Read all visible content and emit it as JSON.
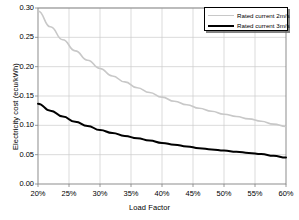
{
  "chart_data": {
    "type": "line",
    "title": "",
    "xlabel": "Load Factor",
    "ylabel": "Electricity cost (ecu/kWh)",
    "xlim": [
      20,
      60
    ],
    "ylim": [
      0.0,
      0.3
    ],
    "grid": true,
    "legend_position": "top-right",
    "x_tick_labels": [
      "20%",
      "25%",
      "30%",
      "35%",
      "40%",
      "45%",
      "50%",
      "55%",
      "60%"
    ],
    "x_tick_values": [
      20,
      25,
      30,
      35,
      40,
      45,
      50,
      55,
      60
    ],
    "y_tick_labels": [
      "0.00",
      "0.05",
      "0.10",
      "0.15",
      "0.20",
      "0.25",
      "0.30"
    ],
    "y_tick_values": [
      0.0,
      0.05,
      0.1,
      0.15,
      0.2,
      0.25,
      0.3
    ],
    "x": [
      20,
      22,
      24,
      26,
      28,
      30,
      32,
      34,
      36,
      38,
      40,
      42,
      44,
      46,
      48,
      50,
      52,
      54,
      56,
      58,
      60
    ],
    "series": [
      {
        "name": "Rated current 2m/s",
        "color": "#c8c8c8",
        "width": 1.6,
        "values": [
          0.295,
          0.268,
          0.246,
          0.227,
          0.211,
          0.197,
          0.184,
          0.174,
          0.164,
          0.156,
          0.148,
          0.141,
          0.135,
          0.129,
          0.124,
          0.119,
          0.115,
          0.111,
          0.107,
          0.102,
          0.098
        ]
      },
      {
        "name": "Rated current 3m/s",
        "color": "#000000",
        "width": 2.0,
        "values": [
          0.137,
          0.125,
          0.115,
          0.106,
          0.099,
          0.092,
          0.087,
          0.082,
          0.078,
          0.074,
          0.07,
          0.067,
          0.064,
          0.061,
          0.059,
          0.057,
          0.055,
          0.053,
          0.051,
          0.048,
          0.045
        ]
      }
    ]
  },
  "legend": {
    "entries": [
      {
        "label": "Rated current 2m/s"
      },
      {
        "label": "Rated current 3m/s"
      }
    ]
  },
  "axes": {
    "plot_area": {
      "left": 38,
      "top": 8,
      "right": 286,
      "bottom": 184
    },
    "frame_color": "#808080",
    "grid_color": "#cccccc"
  }
}
